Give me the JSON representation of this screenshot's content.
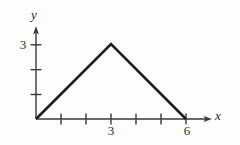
{
  "figure": {
    "title": "",
    "axis_labels": {
      "x": "x",
      "y": "y"
    },
    "tick_labels": {
      "x_three": "3",
      "x_six": "6",
      "y_three": "3"
    },
    "colors": {
      "stroke": "#1c1c1c",
      "axis": "#3a3a3a",
      "background": "#fdfdfd",
      "text": "#2b2b2b"
    }
  },
  "chart_data": {
    "type": "line",
    "title": "",
    "xlabel": "x",
    "ylabel": "y",
    "x": [
      0,
      3,
      6
    ],
    "values": [
      0,
      3,
      0
    ],
    "series": [
      {
        "name": "piecewise-triangle",
        "points": [
          [
            0,
            0
          ],
          [
            3,
            3
          ],
          [
            6,
            0
          ]
        ],
        "values": [
          0,
          3,
          0
        ]
      }
    ],
    "xlim": [
      0,
      7
    ],
    "ylim": [
      0,
      3.8
    ],
    "x_ticks": [
      1,
      2,
      3,
      4,
      5,
      6
    ],
    "x_tick_labels": [
      "",
      "",
      "3",
      "",
      "",
      "6"
    ],
    "y_ticks": [
      1,
      2,
      3
    ],
    "y_tick_labels": [
      "",
      "",
      "3"
    ],
    "grid": false,
    "legend": "none",
    "annotations": [
      {
        "label": "apex",
        "x": 3,
        "y": 3
      }
    ]
  }
}
